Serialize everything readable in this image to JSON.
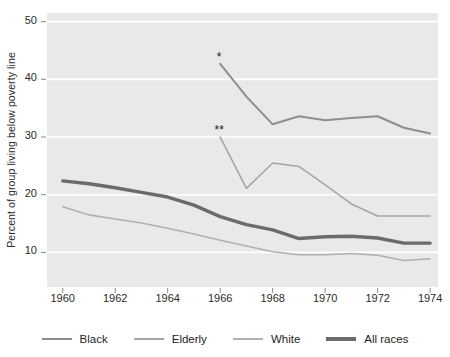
{
  "chart_data": {
    "type": "line",
    "title": "",
    "xlabel": "",
    "ylabel": "Percent of group living below poverty line",
    "xlim": [
      1959.4,
      1974.3
    ],
    "ylim": [
      4.0,
      51.5
    ],
    "xticks": [
      1960,
      1962,
      1964,
      1966,
      1968,
      1970,
      1972,
      1974
    ],
    "xtick_labels": [
      "1960",
      "1962",
      "1964",
      "1966",
      "1968",
      "1970",
      "1972",
      "1974"
    ],
    "yticks": [
      10,
      20,
      30,
      40,
      50
    ],
    "ytick_labels": [
      "10",
      "20",
      "30",
      "40",
      "50"
    ],
    "grid": "horizontal-white-on-gray",
    "legend_position": "bottom",
    "plot_background": "#e9e9e9",
    "grid_color": "#ffffff",
    "series": [
      {
        "name": "Black",
        "color": "#8e8e8e",
        "linewidth": 2.0,
        "marker_note": "*",
        "x": [
          1966,
          1967,
          1968,
          1969,
          1970,
          1971,
          1972,
          1973,
          1974
        ],
        "values": [
          42.7,
          37.0,
          32.2,
          33.6,
          32.9,
          33.3,
          33.6,
          31.6,
          30.6
        ]
      },
      {
        "name": "Elderly",
        "color": "#a6a6a6",
        "linewidth": 1.6,
        "marker_note": "**",
        "x": [
          1966,
          1967,
          1968,
          1969,
          1970,
          1971,
          1972,
          1973,
          1974
        ],
        "values": [
          30.0,
          21.1,
          25.5,
          24.9,
          21.7,
          18.4,
          16.3,
          16.3,
          16.3
        ]
      },
      {
        "name": "White",
        "color": "#b0b0b0",
        "linewidth": 1.6,
        "x": [
          1960,
          1961,
          1962,
          1963,
          1964,
          1965,
          1966,
          1967,
          1968,
          1969,
          1970,
          1971,
          1972,
          1973,
          1974
        ],
        "values": [
          17.9,
          16.5,
          15.8,
          15.1,
          14.2,
          13.2,
          12.1,
          11.1,
          10.1,
          9.6,
          9.6,
          9.8,
          9.5,
          8.6,
          8.9
        ]
      },
      {
        "name": "All races",
        "color": "#6b6b6b",
        "linewidth": 3.4,
        "x": [
          1960,
          1961,
          1962,
          1963,
          1964,
          1965,
          1966,
          1967,
          1968,
          1969,
          1970,
          1971,
          1972,
          1973,
          1974
        ],
        "values": [
          22.4,
          21.9,
          21.2,
          20.4,
          19.6,
          18.2,
          16.2,
          14.8,
          13.9,
          12.4,
          12.7,
          12.8,
          12.5,
          11.6,
          11.6
        ]
      }
    ],
    "annotations": [
      {
        "text": "*",
        "x": 1966,
        "y": 42.7,
        "series": "Black"
      },
      {
        "text": "**",
        "x": 1966,
        "y": 30.0,
        "series": "Elderly"
      }
    ]
  },
  "legend": {
    "items": [
      {
        "label": "Black",
        "color": "#8e8e8e",
        "thickness": 2
      },
      {
        "label": "Elderly",
        "color": "#a6a6a6",
        "thickness": 2
      },
      {
        "label": "White",
        "color": "#b0b0b0",
        "thickness": 2
      },
      {
        "label": "All races",
        "color": "#6b6b6b",
        "thickness": 4
      }
    ]
  }
}
